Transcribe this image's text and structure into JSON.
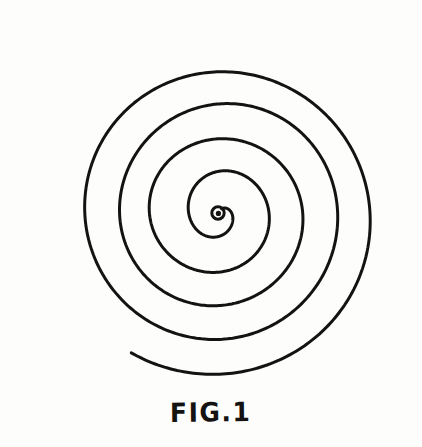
{
  "figure": {
    "caption": "FIG.1",
    "background_color": "#fdfdfc",
    "ink_color": "#141312",
    "center_dot": "filled-dot-with-ring"
  },
  "chart_data": {
    "type": "line",
    "title": "FIG.1",
    "subtitle": "",
    "xlabel": "",
    "ylabel": "",
    "grid": false,
    "legend": null,
    "spiral": {
      "kind": "archimedean",
      "center": [
        218,
        213
      ],
      "turns": 4.5,
      "start_radius": 5,
      "end_radius": 162,
      "direction": "counterclockwise-outward",
      "pitch_px": 35,
      "stroke_width_px": 3
    },
    "bounds": {
      "left": 67,
      "right": 390,
      "top": 34,
      "bottom": 390,
      "width": 323,
      "height": 356
    },
    "crossings_horizontal_left_px": [
      68,
      125,
      165,
      198
    ],
    "crossings_horizontal_right_px": [
      240,
      282,
      323,
      358,
      390
    ],
    "crossings_vertical_above_px": [
      34,
      85,
      128,
      165,
      196
    ],
    "ring_gaps_px": [
      51,
      43,
      37,
      31
    ],
    "terminus": {
      "outer_end": [
        222,
        388
      ],
      "inner_end": [
        218,
        213
      ]
    }
  }
}
